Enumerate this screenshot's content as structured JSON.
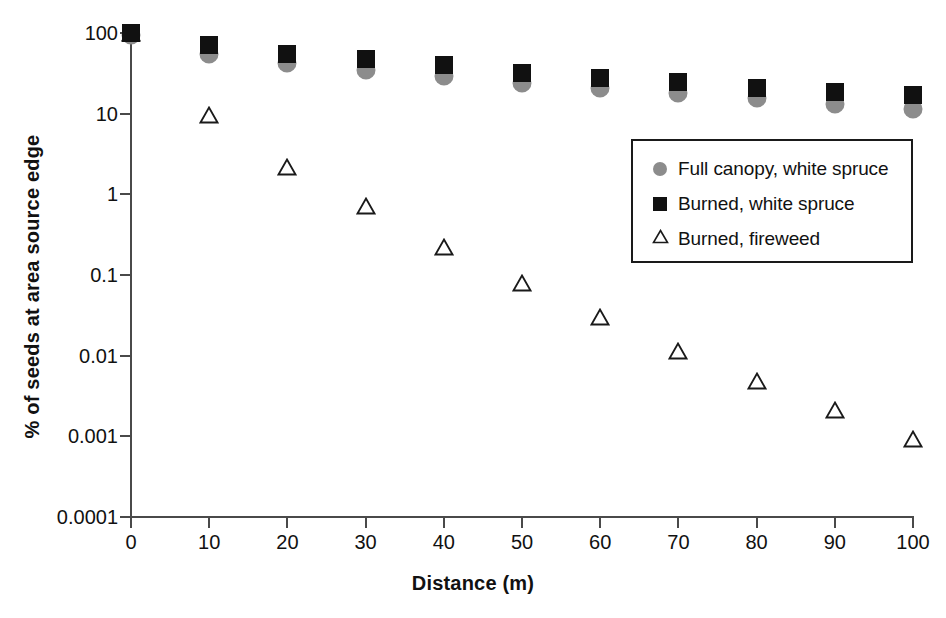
{
  "chart_data": {
    "type": "scatter",
    "title": "",
    "xlabel": "Distance (m)",
    "ylabel": "% of seeds at area source edge",
    "x": [
      0,
      10,
      20,
      30,
      40,
      50,
      60,
      70,
      80,
      90,
      100
    ],
    "xlim": [
      0,
      100
    ],
    "xticks": [
      "0",
      "10",
      "20",
      "30",
      "40",
      "50",
      "60",
      "70",
      "80",
      "90",
      "100"
    ],
    "yscale": "log",
    "ylim": [
      0.0001,
      100
    ],
    "yticks": [
      "100",
      "10",
      "1",
      "0.1",
      "0.01",
      "0.001",
      "0.0001"
    ],
    "ytick_values": [
      100,
      10,
      1,
      0.1,
      0.01,
      0.001,
      0.0001
    ],
    "grid": false,
    "legend_position": "upper right",
    "series": [
      {
        "name": "Full canopy, white spruce",
        "marker": "circle",
        "color": "#8c8c8c",
        "values": [
          95,
          55,
          42,
          35,
          29,
          24,
          21,
          18,
          15.5,
          13,
          11.5
        ]
      },
      {
        "name": "Burned, white spruce",
        "marker": "square",
        "color": "#111111",
        "values": [
          100,
          70,
          55,
          48,
          40,
          32,
          28,
          25,
          21,
          18.5,
          17
        ]
      },
      {
        "name": "Burned, fireweed",
        "marker": "triangle-open",
        "color": "#1a1a1a",
        "values": [
          100,
          9.5,
          2.2,
          0.72,
          0.22,
          0.08,
          0.03,
          0.0115,
          0.0048,
          0.0021,
          0.00092
        ]
      }
    ]
  },
  "legend": {
    "items": [
      {
        "label": "Full canopy, white spruce",
        "marker": "circle"
      },
      {
        "label": "Burned, white spruce",
        "marker": "square"
      },
      {
        "label": "Burned, fireweed",
        "marker": "triangle-open"
      }
    ]
  }
}
